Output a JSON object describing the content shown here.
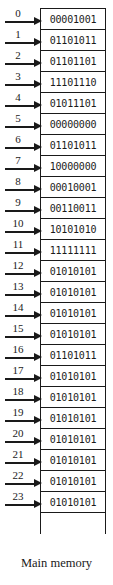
{
  "diagram": {
    "caption": "Main memory",
    "ink_color": "#1a1a1a",
    "background_color": "#ffffff",
    "arrow_icon_name": "right-arrow-icon"
  },
  "memory": {
    "cells": [
      {
        "address": "0",
        "value": "00001001"
      },
      {
        "address": "1",
        "value": "01101011"
      },
      {
        "address": "2",
        "value": "01101101"
      },
      {
        "address": "3",
        "value": "11101110"
      },
      {
        "address": "4",
        "value": "01011101"
      },
      {
        "address": "5",
        "value": "00000000"
      },
      {
        "address": "6",
        "value": "01101011"
      },
      {
        "address": "7",
        "value": "10000000"
      },
      {
        "address": "8",
        "value": "00010001"
      },
      {
        "address": "9",
        "value": "00110011"
      },
      {
        "address": "10",
        "value": "10101010"
      },
      {
        "address": "11",
        "value": "11111111"
      },
      {
        "address": "12",
        "value": "01010101"
      },
      {
        "address": "13",
        "value": "01010101"
      },
      {
        "address": "14",
        "value": "01010101"
      },
      {
        "address": "15",
        "value": "01010101"
      },
      {
        "address": "16",
        "value": "01101011"
      },
      {
        "address": "17",
        "value": "01010101"
      },
      {
        "address": "18",
        "value": "01010101"
      },
      {
        "address": "19",
        "value": "01010101"
      },
      {
        "address": "20",
        "value": "01010101"
      },
      {
        "address": "21",
        "value": "01010101"
      },
      {
        "address": "22",
        "value": "01010101"
      },
      {
        "address": "23",
        "value": "01010101"
      }
    ],
    "trailing_cell": {
      "address": "",
      "value": ""
    }
  }
}
